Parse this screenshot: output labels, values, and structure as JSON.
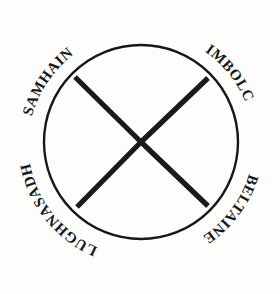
{
  "figure": {
    "name": "celtic-wheel-of-the-year",
    "background_color": "#fdfdfc",
    "ink_color": "#17171a"
  },
  "diagram": {
    "circle": {
      "center_x": 141,
      "center_y": 142,
      "radius": 97,
      "stroke_width": 2.4,
      "color": "#17171a"
    },
    "cross": {
      "stroke_width": 5.2,
      "color": "#1a1a1c",
      "arms": [
        {
          "name": "upper-left-arm",
          "x1": 141,
          "y1": 142,
          "x2": 75,
          "y2": 77
        },
        {
          "name": "upper-right-arm",
          "x1": 141,
          "y1": 142,
          "x2": 208,
          "y2": 78
        },
        {
          "name": "lower-left-arm",
          "x1": 141,
          "y1": 142,
          "x2": 77,
          "y2": 207
        },
        {
          "name": "lower-right-arm",
          "x1": 141,
          "y1": 142,
          "x2": 208,
          "y2": 206
        }
      ]
    }
  },
  "labels": {
    "samhain": {
      "text": "SAMHAIN",
      "position": "upper-left",
      "font_size": 15,
      "orientation": "upright-arc"
    },
    "imbolc": {
      "text": "IMBOLC",
      "position": "upper-right",
      "font_size": 15,
      "orientation": "upright-arc"
    },
    "beltaine": {
      "text": "BELTAINE",
      "position": "lower-right",
      "font_size": 15,
      "orientation": "inverted-arc"
    },
    "lughnasadh": {
      "text": "LUGHNASADH",
      "position": "lower-left",
      "font_size": 15,
      "orientation": "inverted-arc"
    }
  }
}
